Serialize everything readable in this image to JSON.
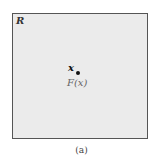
{
  "diagram": {
    "region": {
      "label": "R",
      "fill": "#ebebeb",
      "border": "#555555"
    },
    "point": {
      "label": "x",
      "mapped_label": "F(x)"
    },
    "caption": "(a)"
  }
}
